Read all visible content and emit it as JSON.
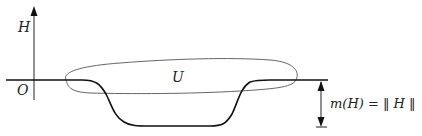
{
  "diagram": {
    "labels": {
      "axis_label": "H",
      "origin_label": "O",
      "region_label": "U",
      "measure_label_lhs": "m(H)",
      "measure_label_eq": " = ‖ ",
      "measure_label_rhs": "H",
      "measure_label_end": " ‖"
    },
    "colors": {
      "stroke": "#222222",
      "region_stroke": "#555555",
      "background": "#ffffff"
    }
  }
}
